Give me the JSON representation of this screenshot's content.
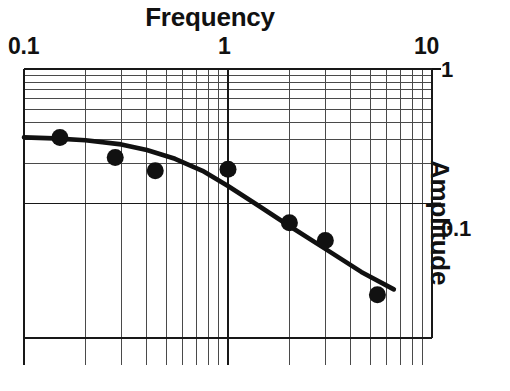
{
  "chart_data": {
    "type": "line",
    "title": "Frequency",
    "xlabel": "Frequency",
    "ylabel": "Amplitude",
    "xscale": "log",
    "yscale": "log",
    "xlim": [
      0.1,
      10
    ],
    "ylim": [
      0.01,
      1
    ],
    "xticks": [
      "0.1",
      "1",
      "10"
    ],
    "xtick_values": [
      0.1,
      1,
      10
    ],
    "yticks": [
      "1",
      "0.1"
    ],
    "ytick_values": [
      1,
      0.1
    ],
    "grid": true,
    "grid_style": "log-log minor grid",
    "legend": null,
    "series": [
      {
        "name": "fitted response curve",
        "type": "line",
        "x": [
          0.1,
          0.14,
          0.2,
          0.3,
          0.4,
          0.55,
          0.75,
          1.0,
          1.4,
          2.0,
          3.0,
          4.5,
          6.5
        ],
        "y": [
          0.31,
          0.305,
          0.295,
          0.275,
          0.25,
          0.215,
          0.175,
          0.135,
          0.097,
          0.068,
          0.046,
          0.031,
          0.023
        ]
      },
      {
        "name": "measured data points",
        "type": "scatter",
        "x": [
          0.15,
          0.28,
          0.44,
          1.0,
          2.0,
          3.0,
          5.4
        ],
        "y": [
          0.31,
          0.22,
          0.175,
          0.18,
          0.072,
          0.053,
          0.021
        ]
      }
    ]
  },
  "axes": {
    "title": "Frequency",
    "x_tick_labels": [
      "0.1",
      "1",
      "10"
    ],
    "y_tick_labels": [
      "1",
      "0.1"
    ],
    "y_axis_title": "Amplitude"
  },
  "caption": {
    "text": ""
  }
}
